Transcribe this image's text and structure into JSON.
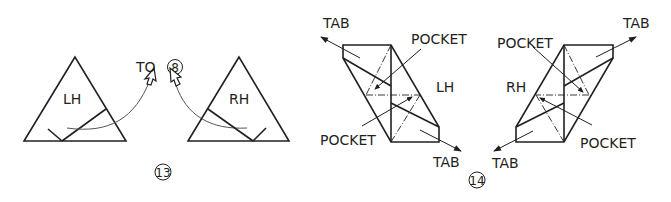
{
  "step13": {
    "number": "13",
    "to_label": "TO",
    "target_step": "8",
    "left_piece": {
      "label": "LH"
    },
    "right_piece": {
      "label": "RH"
    }
  },
  "step14": {
    "number": "14",
    "left_piece": {
      "label": "LH",
      "tab_top": "TAB",
      "tab_bottom": "TAB",
      "pocket_top": "POCKET",
      "pocket_bottom": "POCKET"
    },
    "right_piece": {
      "label": "RH",
      "tab_top": "TAB",
      "tab_bottom": "TAB",
      "pocket_top": "POCKET",
      "pocket_bottom": "POCKET"
    }
  },
  "colors": {
    "line": "#231f20",
    "thin": "#555555"
  }
}
